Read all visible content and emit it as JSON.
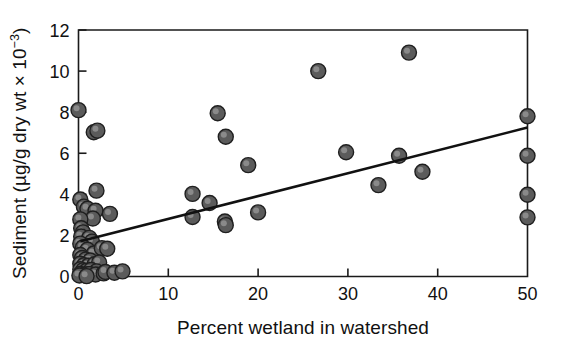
{
  "chart_data": {
    "type": "scatter",
    "title": "",
    "xlabel": "Percent wetland in watershed",
    "ylabel": "Sediment (µg/g dry wt × 10",
    "ylabel_exponent": "−3",
    "ylabel_close": ")",
    "xlim": [
      0,
      50
    ],
    "ylim": [
      0,
      12
    ],
    "xticks": [
      0,
      10,
      20,
      30,
      40,
      50
    ],
    "xtick_labels": [
      "0",
      "10",
      "20",
      "30",
      "40",
      "50"
    ],
    "yticks": [
      0,
      2,
      4,
      6,
      8,
      10,
      12
    ],
    "ytick_labels": [
      "0",
      "2",
      "4",
      "6",
      "8",
      "10",
      "12"
    ],
    "grid": false,
    "legend": "none",
    "marker": {
      "shape": "circle",
      "fill_color": "#5b5b5b",
      "edge_color": "#1f1f1f",
      "highlight_color": "#9a9a9a",
      "radius_px": 7.5
    },
    "trendline": {
      "type": "linear-fit",
      "color": "#111111",
      "width_px": 2.6,
      "x_start": 0.2,
      "y_start": 1.72,
      "x_end": 50.0,
      "y_end": 7.25
    },
    "points": [
      [
        0.0,
        8.1
      ],
      [
        1.7,
        7.02
      ],
      [
        2.1,
        7.1
      ],
      [
        26.7,
        10.0
      ],
      [
        36.8,
        10.9
      ],
      [
        15.5,
        7.95
      ],
      [
        16.4,
        6.8
      ],
      [
        18.9,
        5.42
      ],
      [
        29.8,
        6.05
      ],
      [
        35.7,
        5.88
      ],
      [
        33.4,
        4.45
      ],
      [
        38.3,
        5.1
      ],
      [
        50.0,
        7.8
      ],
      [
        50.0,
        5.88
      ],
      [
        50.0,
        3.98
      ],
      [
        50.0,
        2.88
      ],
      [
        12.7,
        4.02
      ],
      [
        14.6,
        3.58
      ],
      [
        12.7,
        2.9
      ],
      [
        16.3,
        2.68
      ],
      [
        16.4,
        2.5
      ],
      [
        20.0,
        3.12
      ],
      [
        2.0,
        4.18
      ],
      [
        0.2,
        3.75
      ],
      [
        0.6,
        3.4
      ],
      [
        1.0,
        3.3
      ],
      [
        1.9,
        3.2
      ],
      [
        1.6,
        2.82
      ],
      [
        3.5,
        3.05
      ],
      [
        0.2,
        2.78
      ],
      [
        0.3,
        2.35
      ],
      [
        0.5,
        2.15
      ],
      [
        0.3,
        1.95
      ],
      [
        1.2,
        1.88
      ],
      [
        1.5,
        1.7
      ],
      [
        0.2,
        1.6
      ],
      [
        0.5,
        1.42
      ],
      [
        1.0,
        1.3
      ],
      [
        1.7,
        1.12
      ],
      [
        2.6,
        1.38
      ],
      [
        3.2,
        1.35
      ],
      [
        0.2,
        1.05
      ],
      [
        0.4,
        0.9
      ],
      [
        0.8,
        0.82
      ],
      [
        1.3,
        0.78
      ],
      [
        0.2,
        0.62
      ],
      [
        0.6,
        0.55
      ],
      [
        1.1,
        0.52
      ],
      [
        1.8,
        0.6
      ],
      [
        2.3,
        0.68
      ],
      [
        0.2,
        0.35
      ],
      [
        0.5,
        0.3
      ],
      [
        0.9,
        0.28
      ],
      [
        1.4,
        0.32
      ],
      [
        2.0,
        0.25
      ],
      [
        0.2,
        0.12
      ],
      [
        0.7,
        0.1
      ],
      [
        1.2,
        0.12
      ],
      [
        1.9,
        0.1
      ],
      [
        2.8,
        0.15
      ],
      [
        3.0,
        0.22
      ],
      [
        4.0,
        0.18
      ],
      [
        4.9,
        0.25
      ],
      [
        0.1,
        0.05
      ],
      [
        0.9,
        0.02
      ]
    ]
  }
}
